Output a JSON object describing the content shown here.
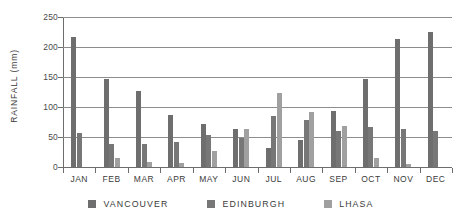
{
  "chart_data": {
    "type": "bar",
    "title": "",
    "subtitle": "",
    "xlabel": "",
    "ylabel": "RAINFALL (mm)",
    "ylim": [
      0,
      250
    ],
    "yticks": [
      0,
      50,
      100,
      150,
      200,
      250
    ],
    "ytick_labels": [
      "0",
      "50",
      "100",
      "150",
      "200",
      "250"
    ],
    "grid": true,
    "grid_axis": "y",
    "legend_position": "bottom",
    "categories": [
      "JAN",
      "FEB",
      "MAR",
      "APR",
      "MAY",
      "JUN",
      "JUL",
      "AUG",
      "SEP",
      "OCT",
      "NOV",
      "DEC"
    ],
    "series": [
      {
        "name": "VANCOUVER",
        "color": "#6e6e6e",
        "values": [
          216,
          147,
          127,
          87,
          72,
          64,
          32,
          45,
          93,
          147,
          213,
          225
        ]
      },
      {
        "name": "EDINBURGH",
        "color": "#777777",
        "values": [
          57,
          39,
          39,
          42,
          54,
          48,
          85,
          78,
          60,
          66,
          63,
          60
        ]
      },
      {
        "name": "LHASA",
        "color": "#a0a0a0",
        "values": [
          0,
          15,
          9,
          6,
          26,
          63,
          123,
          91,
          68,
          15,
          5,
          0
        ]
      }
    ]
  },
  "legend": {
    "items": [
      {
        "label": "VANCOUVER"
      },
      {
        "label": "EDINBURGH"
      },
      {
        "label": "LHASA"
      }
    ]
  }
}
